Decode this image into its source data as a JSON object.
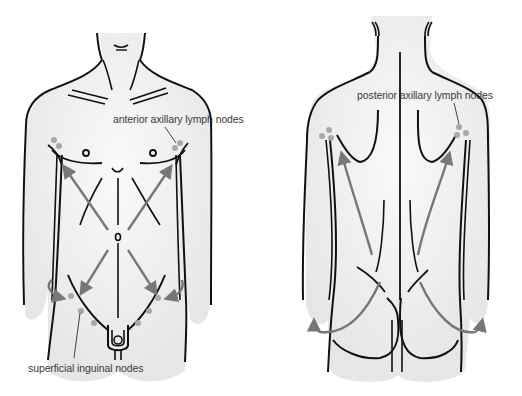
{
  "diagram": {
    "type": "anatomical illustration",
    "views": [
      {
        "id": "anterior",
        "description": "front view of male torso with lymph drainage arrows"
      },
      {
        "id": "posterior",
        "description": "back view of torso with lymph drainage arrows"
      }
    ],
    "labels": {
      "anterior_axillary": "anterior axillary lymph nodes",
      "superficial_inguinal": "superficial inguinal nodes",
      "posterior_axillary": "posterior axillary lymph nodes"
    },
    "colors": {
      "outline": "#111111",
      "body_fill": "#eeeeee",
      "arrow": "#777777",
      "node": "#a8a8a8",
      "label_text": "#3a3a3a"
    }
  }
}
